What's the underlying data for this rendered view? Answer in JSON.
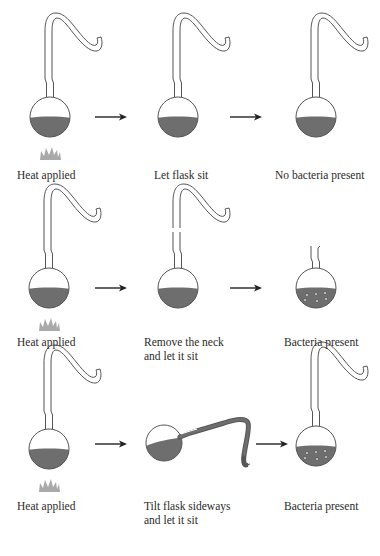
{
  "colors": {
    "glass_stroke": "#555555",
    "liquid": "#6e6e6e",
    "liquid_edge": "#4a4a4a",
    "flame": "#9a9a9a",
    "arrow": "#222222",
    "bacteria": "#bdbdbd",
    "text": "#2a2a2a"
  },
  "rows": [
    {
      "steps": [
        {
          "label": "Heat applied",
          "flask": "swan-neck",
          "heat": true
        },
        {
          "label": "Let flask sit",
          "flask": "swan-neck",
          "heat": false
        },
        {
          "label": "No bacteria present",
          "flask": "swan-neck",
          "bacteria": false
        }
      ]
    },
    {
      "steps": [
        {
          "label": "Heat applied",
          "flask": "swan-neck",
          "heat": true
        },
        {
          "label_line1": "Remove the neck",
          "label_line2": "and let it sit",
          "flask": "swan-neck-broken"
        },
        {
          "label": "Bacteria present",
          "flask": "short-neck-open",
          "bacteria": true
        }
      ]
    },
    {
      "steps": [
        {
          "label": "Heat applied",
          "flask": "swan-neck",
          "heat": true
        },
        {
          "label_line1": "Tilt flask sideways",
          "label_line2": "and let it sit",
          "flask": "swan-neck-tilted"
        },
        {
          "label": "Bacteria present",
          "flask": "swan-neck",
          "bacteria": true
        }
      ]
    }
  ]
}
